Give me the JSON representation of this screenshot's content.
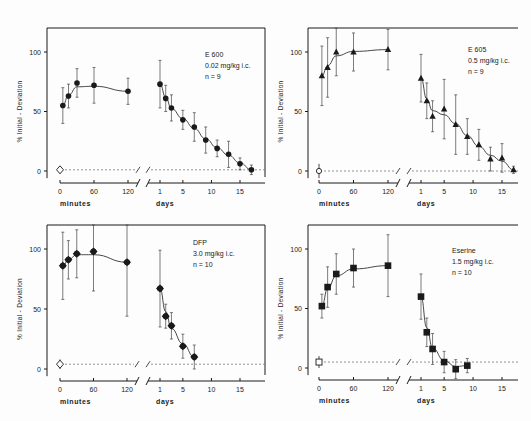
{
  "chart_data": [
    {
      "type": "scatter",
      "title": "E 600",
      "legend": [
        "E 600",
        "0.02 mg/kg i.c.",
        "n = 9"
      ],
      "marker": "circle",
      "ylabel": "% Initial - Deviation",
      "xlabel_left": "minutes",
      "xlabel_right": "days",
      "yticks": [
        0,
        50,
        100
      ],
      "ylim": [
        0,
        120
      ],
      "minute_ticks": [
        0,
        60,
        120
      ],
      "day_ticks": [
        1,
        5,
        10,
        15
      ],
      "baseline": {
        "value": 1,
        "sd": 3,
        "marker": "open-diamond"
      },
      "minutes": {
        "x": [
          5,
          15,
          30,
          60,
          120
        ],
        "y": [
          55,
          63,
          74,
          72,
          67
        ],
        "err": [
          15,
          10,
          12,
          15,
          11
        ]
      },
      "days": {
        "x": [
          1,
          2,
          3,
          5,
          7,
          9,
          11,
          13,
          15,
          17
        ],
        "y": [
          73,
          61,
          53,
          43,
          37,
          26,
          19,
          14,
          6,
          1
        ],
        "err": [
          20,
          11,
          11,
          8,
          12,
          11,
          7,
          11,
          5,
          4
        ]
      }
    },
    {
      "type": "scatter",
      "title": "E 605",
      "legend": [
        "E 605",
        "0.5 mg/kg i.c.",
        "n = 9"
      ],
      "marker": "triangle",
      "ylabel": "% Initial - Deviation",
      "xlabel_left": "minutes",
      "xlabel_right": "days",
      "yticks": [
        0,
        50,
        100
      ],
      "ylim": [
        0,
        120
      ],
      "minute_ticks": [
        0,
        60,
        120
      ],
      "day_ticks": [
        1,
        5,
        10,
        15
      ],
      "baseline": {
        "value": 0,
        "sd": 6,
        "marker": "open-circle"
      },
      "minutes": {
        "x": [
          5,
          15,
          30,
          60,
          120
        ],
        "y": [
          80,
          87,
          100,
          100,
          102
        ],
        "err": [
          25,
          25,
          20,
          16,
          17
        ]
      },
      "days": {
        "x": [
          1,
          2,
          3,
          5,
          7,
          9,
          11,
          13,
          15,
          17
        ],
        "y": [
          78,
          59,
          46,
          52,
          39,
          29,
          22,
          10,
          11,
          1
        ],
        "err": [
          20,
          15,
          13,
          25,
          25,
          15,
          13,
          10,
          12,
          3
        ]
      }
    },
    {
      "type": "scatter",
      "title": "DFP",
      "legend": [
        "DFP",
        "3.0 mg/kg i.c.",
        "n = 10"
      ],
      "marker": "diamond",
      "ylabel": "% Initial - Deviation",
      "xlabel_left": "minutes",
      "xlabel_right": "days",
      "yticks": [
        0,
        50,
        100
      ],
      "ylim": [
        0,
        120
      ],
      "minute_ticks": [
        0,
        60,
        120
      ],
      "day_ticks": [
        1,
        5,
        10,
        15
      ],
      "baseline": {
        "value": 4,
        "sd": 4,
        "marker": "open-diamond"
      },
      "minutes": {
        "x": [
          5,
          15,
          30,
          60,
          120
        ],
        "y": [
          86,
          91,
          96,
          98,
          89
        ],
        "err": [
          28,
          16,
          20,
          33,
          45
        ]
      },
      "days": {
        "x": [
          1,
          2,
          3,
          5,
          7
        ],
        "y": [
          67,
          44,
          36,
          19,
          10
        ],
        "err": [
          32,
          10,
          11,
          10,
          10
        ]
      }
    },
    {
      "type": "scatter",
      "title": "Eserine",
      "legend": [
        "Eserine",
        "1.5 mg/kg i.c.",
        "n = 10"
      ],
      "marker": "square",
      "ylabel": "% Initial - Deviation",
      "xlabel_left": "minutes",
      "xlabel_right": "days",
      "yticks": [
        0,
        50,
        100
      ],
      "ylim": [
        0,
        120
      ],
      "minute_ticks": [
        0,
        60,
        120
      ],
      "day_ticks": [
        1,
        5,
        10,
        15
      ],
      "baseline": {
        "value": 5,
        "sd": 5,
        "marker": "open-square"
      },
      "minutes": {
        "x": [
          5,
          15,
          30,
          60,
          120
        ],
        "y": [
          52,
          68,
          79,
          84,
          86
        ],
        "err": [
          10,
          17,
          17,
          16,
          26
        ]
      },
      "days": {
        "x": [
          1,
          2,
          3,
          5,
          7,
          9
        ],
        "y": [
          60,
          30,
          16,
          5,
          -1,
          2
        ],
        "err": [
          19,
          12,
          13,
          9,
          8,
          6
        ]
      }
    }
  ],
  "panels_layout": [
    {
      "yaxis_x": 47,
      "top": 28,
      "right": 265,
      "y0": 171,
      "y100": 52,
      "min0": 60,
      "min120": 128,
      "day1": 160,
      "day15": 240,
      "xaxis_y": 183,
      "open_box": true,
      "legend_x": 205,
      "legend_y": 57
    },
    {
      "yaxis_x": 308,
      "top": 28,
      "right": 518,
      "y0": 171,
      "y100": 52,
      "min0": 319,
      "min120": 388,
      "day1": 421,
      "day15": 502,
      "xaxis_y": 183,
      "open_box": false,
      "legend_x": 468,
      "legend_y": 52
    },
    {
      "yaxis_x": 47,
      "top": 225,
      "right": 265,
      "y0": 369,
      "y100": 249,
      "min0": 60,
      "min120": 127,
      "day1": 160,
      "day15": 240,
      "xaxis_y": 381,
      "open_box": true,
      "legend_x": 193,
      "legend_y": 245
    },
    {
      "yaxis_x": 308,
      "top": 225,
      "right": 518,
      "y0": 368,
      "y100": 249,
      "min0": 319,
      "min120": 388,
      "day1": 421,
      "day15": 502,
      "xaxis_y": 380,
      "open_box": false,
      "legend_x": 452,
      "legend_y": 253
    }
  ]
}
